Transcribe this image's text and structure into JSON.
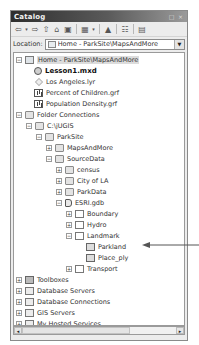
{
  "window": {
    "title": "Catalog",
    "buttons": {
      "restore": "□",
      "close": "×"
    }
  },
  "toolbar": {
    "tools": [
      {
        "name": "back-arrow-icon",
        "glyph": "⇦"
      },
      {
        "name": "back-dropdown-icon",
        "glyph": "▾"
      },
      {
        "name": "forward-arrow-icon",
        "glyph": "⇨"
      },
      {
        "name": "up-one-level-icon",
        "glyph": "⇧"
      },
      {
        "name": "home-folder-icon",
        "glyph": "⌂"
      },
      {
        "name": "connect-folder-icon",
        "glyph": "▣"
      },
      {
        "name": "view-grid-icon",
        "glyph": "▦"
      },
      {
        "name": "view-dropdown-icon",
        "glyph": "▾"
      },
      {
        "name": "add-data-icon",
        "glyph": "▲"
      },
      {
        "name": "toggle-tree-icon",
        "glyph": "☷"
      },
      {
        "name": "options-icon",
        "glyph": "▤"
      }
    ]
  },
  "location": {
    "label": "Location:",
    "value": "Home - ParkSite\\MapsAndMore",
    "dropdown_glyph": "▼"
  },
  "tree": {
    "items": [
      {
        "label": "Home - ParkSite\\MapsAndMore",
        "depth": 0,
        "expander": "−",
        "icon": "home",
        "selected": true
      },
      {
        "label": "Lesson1.mxd",
        "depth": 1,
        "expander": "",
        "icon": "mxd",
        "bold": true
      },
      {
        "label": "Los Angeles.lyr",
        "depth": 1,
        "expander": "",
        "icon": "lyr"
      },
      {
        "label": "Percent of Children.grf",
        "depth": 1,
        "expander": "",
        "icon": "grf"
      },
      {
        "label": "Population Density.grf",
        "depth": 1,
        "expander": "",
        "icon": "grf"
      },
      {
        "label": "Folder Connections",
        "depth": 0,
        "expander": "−",
        "icon": "folder"
      },
      {
        "label": "C:\\jUGIS",
        "depth": 1,
        "expander": "−",
        "icon": "folder"
      },
      {
        "label": "ParkSite",
        "depth": 2,
        "expander": "−",
        "icon": "folder"
      },
      {
        "label": "MapsAndMore",
        "depth": 3,
        "expander": "+",
        "icon": "folder"
      },
      {
        "label": "SourceData",
        "depth": 3,
        "expander": "−",
        "icon": "folder"
      },
      {
        "label": "census",
        "depth": 4,
        "expander": "+",
        "icon": "folder"
      },
      {
        "label": "City of LA",
        "depth": 4,
        "expander": "+",
        "icon": "folder"
      },
      {
        "label": "ParkData",
        "depth": 4,
        "expander": "+",
        "icon": "folder"
      },
      {
        "label": "ESRI.gdb",
        "depth": 4,
        "expander": "−",
        "icon": "gdb"
      },
      {
        "label": "Boundary",
        "depth": 5,
        "expander": "+",
        "icon": "fds"
      },
      {
        "label": "Hydro",
        "depth": 5,
        "expander": "+",
        "icon": "fds"
      },
      {
        "label": "Landmark",
        "depth": 5,
        "expander": "−",
        "icon": "fds"
      },
      {
        "label": "Parkland",
        "depth": 6,
        "expander": "",
        "icon": "fc"
      },
      {
        "label": "Place_ply",
        "depth": 6,
        "expander": "",
        "icon": "fc"
      },
      {
        "label": "Transport",
        "depth": 5,
        "expander": "+",
        "icon": "fds"
      },
      {
        "label": "Toolboxes",
        "depth": 0,
        "expander": "+",
        "icon": "tool"
      },
      {
        "label": "Database Servers",
        "depth": 0,
        "expander": "+",
        "icon": "srv"
      },
      {
        "label": "Database Connections",
        "depth": 0,
        "expander": "+",
        "icon": "srv"
      },
      {
        "label": "GIS Servers",
        "depth": 0,
        "expander": "+",
        "icon": "srv"
      },
      {
        "label": "My Hosted Services",
        "depth": 0,
        "expander": "+",
        "icon": "srv"
      }
    ]
  },
  "scrollbar": {
    "left": "◂",
    "right": "▸"
  },
  "annotation": {
    "points_to": "Parkland"
  }
}
